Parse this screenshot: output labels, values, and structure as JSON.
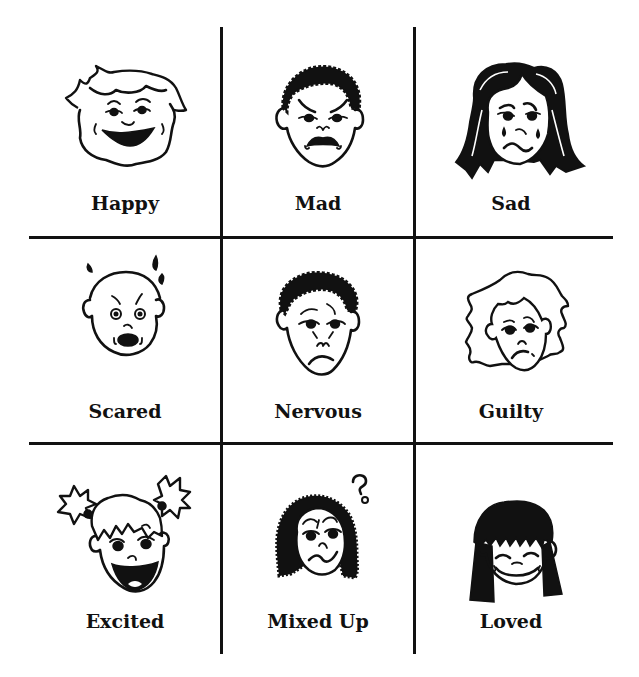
{
  "grid": {
    "rows": 3,
    "columns": 3,
    "line_color": "#111111",
    "background": "#ffffff"
  },
  "cells": [
    {
      "label": "Happy",
      "icon": "happy-face-icon",
      "description": "boy with wavy hair, big open smile"
    },
    {
      "label": "Mad",
      "icon": "mad-face-icon",
      "description": "curly-haired boy, angled brows, gritted teeth"
    },
    {
      "label": "Sad",
      "icon": "sad-face-icon",
      "description": "girl with long dark hair, tears, wavy frown"
    },
    {
      "label": "Scared",
      "icon": "scared-face-icon",
      "description": "bald child with sweat drops, round open mouth"
    },
    {
      "label": "Nervous",
      "icon": "nervous-face-icon",
      "description": "curly-haired boy, worried brows, small frown"
    },
    {
      "label": "Guilty",
      "icon": "guilty-face-icon",
      "description": "child with shaggy hair, crooked frown"
    },
    {
      "label": "Excited",
      "icon": "excited-face-icon",
      "description": "girl with pigtails, wide open mouth"
    },
    {
      "label": "Mixed Up",
      "icon": "mixed-up-face-icon",
      "description": "girl with braided hair, question mark above head"
    },
    {
      "label": "Loved",
      "icon": "loved-face-icon",
      "description": "girl with black bangs, closed smiling eyes"
    }
  ],
  "decorations": {
    "question_mark": "?"
  }
}
